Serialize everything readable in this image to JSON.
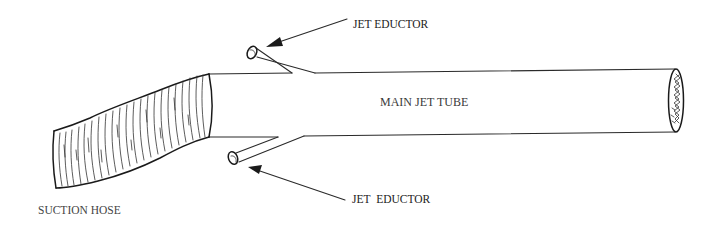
{
  "figure": {
    "type": "technical-illustration"
  },
  "labels": {
    "jet_eductor_top": "JET EDUCTOR",
    "main_jet_tube": "MAIN JET TUBE",
    "jet_eductor_bottom": "JET EDUCTOR",
    "suction_hose": "SUCTION HOSE"
  },
  "colors": {
    "background": "#ffffff",
    "ink": "#2a2a2a"
  }
}
